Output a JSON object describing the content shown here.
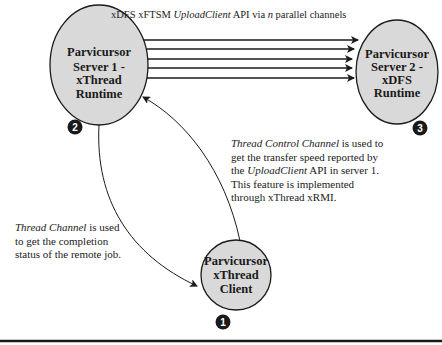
{
  "colors": {
    "node_fill": "#d9d9d9",
    "stroke": "#1a1a1a",
    "badge_fill": "#1a1a1a",
    "background": "#ffffff"
  },
  "nodes": {
    "server1": {
      "lines": [
        "Parvicursor",
        "Server 1 -",
        "xThread",
        "Runtime"
      ],
      "badge": "2"
    },
    "server2": {
      "lines": [
        "Parvicursor",
        "Server 2 -",
        "xDFS",
        "Runtime"
      ],
      "badge": "3"
    },
    "client": {
      "lines": [
        "Parvicursor",
        "xThread",
        "Client"
      ],
      "badge": "1"
    }
  },
  "channels": {
    "caption": {
      "prefix": "xDFS xFTSM ",
      "api_name": "UploadClient",
      "middle": " API via ",
      "n": "n",
      "suffix": " parallel channels"
    },
    "count": 5
  },
  "notes": {
    "thread_control": {
      "title": "Thread Control Channel",
      "text1": " is used to get the transfer speed reported by the ",
      "api_name": "UploadClient",
      "text2": " API in server 1. This feature is implemented through xThread xRMI."
    },
    "thread_channel": {
      "title": "Thread Channel",
      "text1": " is used to get the completion status of the remote job."
    }
  }
}
